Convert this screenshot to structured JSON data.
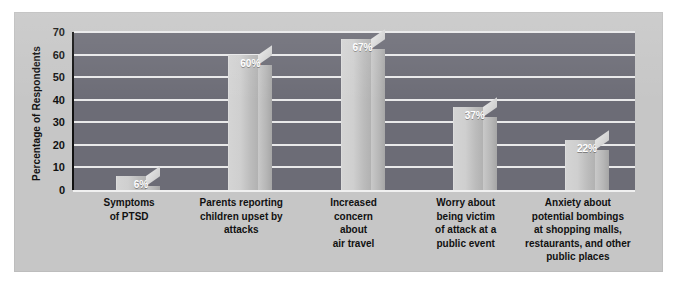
{
  "chart_data": {
    "type": "bar",
    "title": "",
    "subtitle": "",
    "xlabel": "",
    "ylabel": "Percentage of Respondents",
    "ylim": [
      0,
      70
    ],
    "ytick_step": 10,
    "yticks": [
      "70",
      "60",
      "50",
      "40",
      "30",
      "20",
      "10",
      "0"
    ],
    "grid": true,
    "legend": "none",
    "style": "3d-column",
    "categories": [
      "Symptoms\nof PTSD",
      "Parents reporting\nchildren upset by\nattacks",
      "Increased\nconcern\nabout\nair travel",
      "Worry about\nbeing victim\nof attack at a\npublic event",
      "Anxiety about\npotential bombings\nat shopping malls,\nrestaurants, and other\npublic places"
    ],
    "values": [
      6,
      60,
      67,
      37,
      22
    ],
    "data_labels": [
      "6%",
      "60%",
      "67%",
      "37%",
      "22%"
    ],
    "bars": [
      {
        "label": "Symptoms of PTSD",
        "lines": [
          "Symptoms",
          "of PTSD"
        ],
        "value": 6,
        "data_label": "6%"
      },
      {
        "label": "Parents reporting children upset by attacks",
        "lines": [
          "Parents reporting",
          "children upset by",
          "attacks"
        ],
        "value": 60,
        "data_label": "60%"
      },
      {
        "label": "Increased concern about air travel",
        "lines": [
          "Increased",
          "concern",
          "about",
          "air travel"
        ],
        "value": 67,
        "data_label": "67%"
      },
      {
        "label": "Worry about being victim of attack at a public event",
        "lines": [
          "Worry about",
          "being victim",
          "of attack at a",
          "public event"
        ],
        "value": 37,
        "data_label": "37%"
      },
      {
        "label": "Anxiety about potential bombings at shopping malls, restaurants, and other public places",
        "lines": [
          "Anxiety about",
          "potential bombings",
          "at shopping malls,",
          "restaurants, and other",
          "public places"
        ],
        "value": 22,
        "data_label": "22%"
      }
    ]
  },
  "colors": {
    "panel_background": "#c6c6c6",
    "plot_background": "#6e6e78",
    "gridline": "#e9e9ea",
    "bar_face": "#cfcfcf",
    "bar_side": "#b6b6b6",
    "axis": "#111111",
    "data_label_text": "#ffffff",
    "tick_text": "#111111"
  }
}
